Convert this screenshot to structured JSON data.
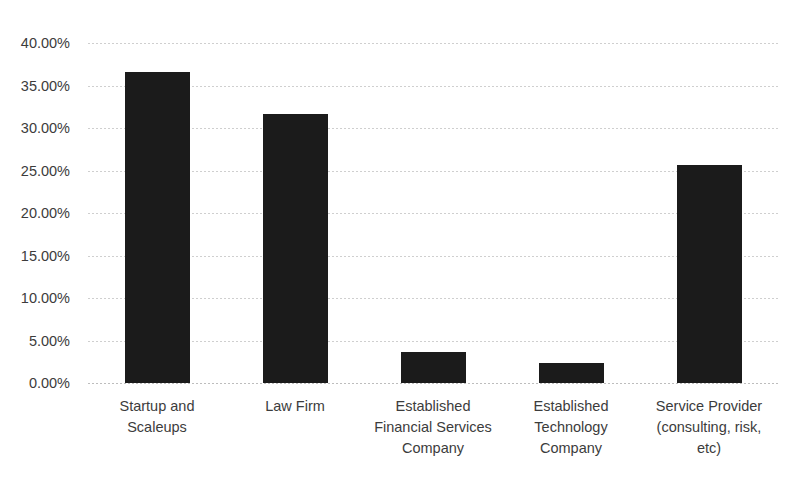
{
  "chart_data": {
    "type": "bar",
    "title": "",
    "subtitle": "",
    "xlabel": "",
    "ylabel": "",
    "categories": [
      "Startup and Scaleups",
      "Law Firm",
      "Established Financial Services Company",
      "Established Technology Company",
      "Service Provider (consulting, risk, etc)"
    ],
    "values": [
      36.6,
      31.7,
      3.7,
      2.4,
      25.6
    ],
    "value_labels": [
      "36.60%",
      "31.70%",
      "3.70%",
      "2.40%",
      "25.60%"
    ],
    "ylim": [
      0,
      40
    ],
    "ytick_values": [
      0,
      5,
      10,
      15,
      20,
      25,
      30,
      35,
      40
    ],
    "ytick_labels": [
      "0.00%",
      "5.00%",
      "10.00%",
      "15.00%",
      "20.00%",
      "25.00%",
      "30.00%",
      "35.00%",
      "40.00%"
    ],
    "grid": true,
    "grid_style": "dotted-horizontal",
    "legend": false,
    "bar_color": "#1b1b1b",
    "background_color": "#ffffff",
    "axis_text_color": "#3c3c3c"
  },
  "title": {
    "text": "",
    "note": "chart title is cropped off the top edge of the screenshot"
  },
  "axis": {
    "x_category_lines": [
      [
        "Startup and",
        "Scaleups"
      ],
      [
        "Law Firm"
      ],
      [
        "Established",
        "Financial Services",
        "Company"
      ],
      [
        "Established",
        "Technology",
        "Company"
      ],
      [
        "Service Provider",
        "(consulting, risk,",
        "etc)"
      ]
    ]
  }
}
